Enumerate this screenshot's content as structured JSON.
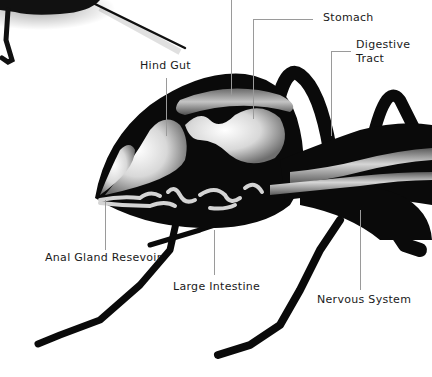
{
  "diagram": {
    "labels": [
      {
        "id": "stomach",
        "text": "Stomach"
      },
      {
        "id": "digestive-tract",
        "text": "Digestive\nTract"
      },
      {
        "id": "hind-gut",
        "text": "Hind Gut"
      },
      {
        "id": "anal-gland-reservoir",
        "text": "Anal Gland Resevoir"
      },
      {
        "id": "large-intestine",
        "text": "Large Intestine"
      },
      {
        "id": "nervous-system",
        "text": "Nervous System"
      }
    ]
  },
  "colors": {
    "background": "#ffffff",
    "body": "#0a0a0a",
    "organ_light": "#e8e8e8",
    "organ_mid": "#9a9a9a",
    "leader_line": "#9a9a9a",
    "label_text": "#1a1a1a"
  }
}
